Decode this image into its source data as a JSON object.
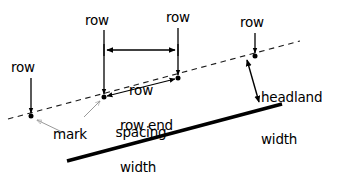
{
  "figure": {
    "type": "technical-diagram",
    "background_color": "#ffffff",
    "ink_color": "#000000",
    "leader_color": "#9a9a9a"
  },
  "labels": {
    "row_left": "row",
    "row_mid_left": "row",
    "row_mid_right": "row",
    "row_right": "row",
    "row_spacing_line1": "row",
    "row_spacing_line2": "spacing",
    "row_end_line1": "row end",
    "row_end_line2": "width",
    "headland_line1": "headland",
    "headland_line2": "width",
    "mark": "mark"
  },
  "geometry": {
    "dashed_guide_line": {
      "x1": 8,
      "y1": 119,
      "x2": 300,
      "y2": 41,
      "style": "dashed"
    },
    "headland_boundary_line": {
      "x1": 67,
      "y1": 161,
      "x2": 282,
      "y2": 104,
      "style": "solid-thick"
    },
    "row_marks": [
      {
        "name": "mark-left",
        "x": 31,
        "y": 116
      },
      {
        "name": "mark-mid-left",
        "x": 104,
        "y": 97
      },
      {
        "name": "mark-mid-right",
        "x": 178,
        "y": 78
      },
      {
        "name": "mark-right",
        "x": 255,
        "y": 56
      }
    ],
    "row_pointers": [
      {
        "name": "row-pointer-left",
        "x": 31,
        "y_top": 78,
        "y_bottom": 114
      },
      {
        "name": "row-pointer-mid-left",
        "x": 104,
        "y_top": 30,
        "y_bottom": 95
      },
      {
        "name": "row-pointer-mid-right",
        "x": 178,
        "y_top": 28,
        "y_bottom": 76
      },
      {
        "name": "row-pointer-right",
        "x": 255,
        "y_top": 33,
        "y_bottom": 54
      }
    ],
    "row_spacing_dimension": {
      "x1": 104,
      "x2": 178,
      "y": 50,
      "arrows": "both"
    },
    "row_end_dimension": {
      "x1": 104,
      "y1": 97,
      "x2": 178,
      "y2": 78,
      "arrows": "both"
    },
    "headland_dimension": {
      "x1": 247,
      "y1": 58,
      "x2": 259,
      "y2": 104,
      "arrows": "both"
    },
    "mark_leader": {
      "from_x": 62,
      "from_y": 132,
      "to_x": 36,
      "to_y": 119
    },
    "mark_leader_secondary": {
      "from_x": 84,
      "from_y": 117,
      "to_x": 101,
      "to_y": 100
    }
  },
  "label_positions": {
    "row_left": {
      "x": 11,
      "y": 61
    },
    "row_mid_left": {
      "x": 85,
      "y": 14
    },
    "row_mid_right": {
      "x": 166,
      "y": 11
    },
    "row_right": {
      "x": 240,
      "y": 16
    },
    "row_spacing": {
      "x": 106,
      "y": 55
    },
    "row_end_width": {
      "x": 120,
      "y": 90
    },
    "headland_width": {
      "x": 261,
      "y": 62
    },
    "mark": {
      "x": 53,
      "y": 128
    }
  }
}
